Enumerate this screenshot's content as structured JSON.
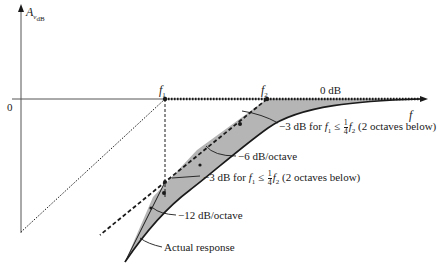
{
  "axes": {
    "y_label": "A",
    "y_label_sub": "v",
    "y_label_subsub": "dB",
    "x_label": "f",
    "origin_label": "0"
  },
  "markers": {
    "f1": "f",
    "f1_sub": "1",
    "f2": "f",
    "f2_sub": "2",
    "zero_db": "0 dB"
  },
  "annotations": {
    "upper_3db_prefix": "−3 dB for ",
    "upper_3db_f1": "f",
    "upper_3db_f1_sub": "1",
    "upper_3db_le": " ≤ ",
    "upper_3db_frac_num": "1",
    "upper_3db_frac_den": "4",
    "upper_3db_f2": "f",
    "upper_3db_f2_sub": "2",
    "upper_3db_suffix": " (2 octaves below)",
    "slope_6db": "−6 dB/octave",
    "lower_3db_prefix": "−3 dB for ",
    "lower_3db_f1": "f",
    "lower_3db_f1_sub": "1",
    "lower_3db_le": " ≤ ",
    "lower_3db_frac_num": "1",
    "lower_3db_frac_den": "4",
    "lower_3db_f2": "f",
    "lower_3db_f2_sub": "2",
    "lower_3db_suffix": " (2 octaves below)",
    "slope_12db": "−12 dB/octave",
    "actual_response": "Actual response"
  },
  "colors": {
    "line": "#1a1a1a",
    "shade": "#b5b5b5",
    "axis": "#555555"
  }
}
